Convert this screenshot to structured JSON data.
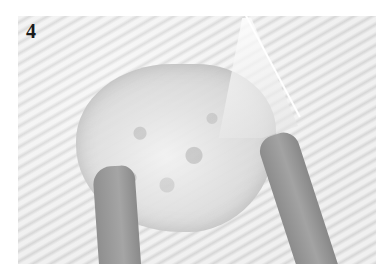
{
  "figure": {
    "step_number": "4",
    "colors": {
      "border": "#ffffff",
      "background": "#e6e6e6",
      "skin_tone_gray": "#999999",
      "label": "#1a1a1a"
    }
  }
}
